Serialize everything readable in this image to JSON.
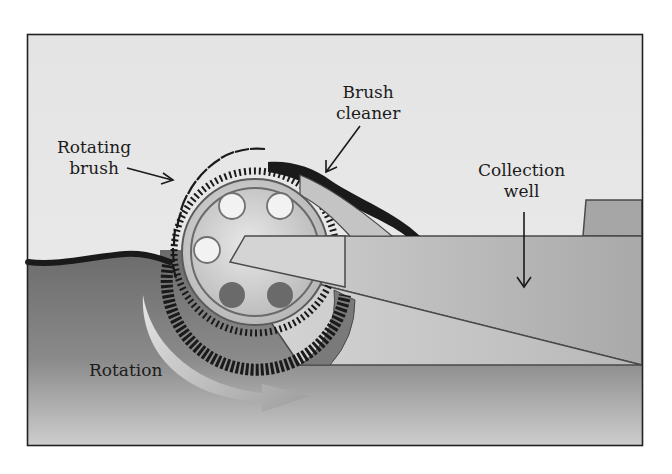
{
  "diagram": {
    "type": "schematic",
    "labels": {
      "rotating_brush": {
        "line1": "Rotating",
        "line2": "brush"
      },
      "brush_cleaner": {
        "line1": "Brush",
        "line2": "cleaner"
      },
      "collection_well": {
        "line1": "Collection",
        "line2": "well"
      },
      "rotation": "Rotation"
    },
    "components": [
      "rotating-brush-drum",
      "brush-cleaner",
      "collection-well",
      "ramp",
      "water-surface",
      "oil-slick",
      "rotation-arrow"
    ],
    "colors": {
      "background": "#e6e6e6",
      "water_top": "#6e6e6e",
      "water_bottom": "#c8c8c8",
      "oil": "#1a1a1a",
      "drum": "#cfcfcf",
      "hole_light": "#f2f2f2",
      "hole_dark": "#6a6a6a",
      "outline": "#4a4a4a",
      "frame": "#222222"
    }
  }
}
